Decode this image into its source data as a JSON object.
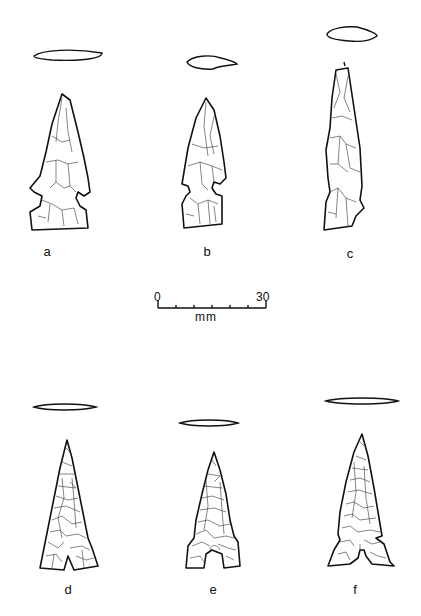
{
  "figure": {
    "type": "archaeological line drawings of chipped-stone projectile points",
    "specimens": [
      {
        "id": "a",
        "label": "a",
        "form": "side-notched point, broad base"
      },
      {
        "id": "b",
        "label": "b",
        "form": "side-notched point, narrow"
      },
      {
        "id": "c",
        "label": "c",
        "form": "elongated side-notched point, fragmentary"
      },
      {
        "id": "d",
        "label": "d",
        "form": "triangular basally-notched point"
      },
      {
        "id": "e",
        "label": "e",
        "form": "triangular point with basal notch"
      },
      {
        "id": "f",
        "label": "f",
        "form": "triangular barbed point with basal notch"
      }
    ],
    "scale_bar": {
      "start_label": "0",
      "end_label": "30",
      "unit": "mm",
      "ticks": 7
    }
  },
  "colors": {
    "ink": "#111111",
    "background": "#ffffff"
  }
}
